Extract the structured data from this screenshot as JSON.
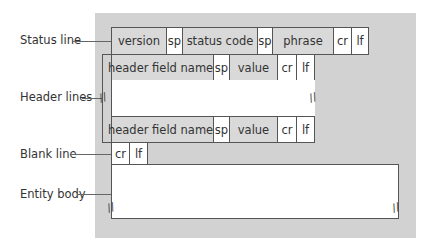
{
  "labels": {
    "status_line": "Status line",
    "header_lines": "Header lines",
    "blank_line": "Blank line",
    "entity_body": "Entity body"
  },
  "status_line": {
    "version": "version",
    "sp1": "sp",
    "status_code": "status code",
    "sp2": "sp",
    "phrase": "phrase",
    "cr": "cr",
    "lf": "lf"
  },
  "header_rows": [
    {
      "name": "header field name:",
      "sp": "sp",
      "value": "value",
      "cr": "cr",
      "lf": "lf"
    },
    {
      "name": "header field name:",
      "sp": "sp",
      "value": "value",
      "cr": "cr",
      "lf": "lf"
    }
  ],
  "blank_line": {
    "cr": "cr",
    "lf": "lf"
  },
  "break_mark": "//",
  "colors": {
    "panel": "#d2d2d2",
    "cell_gray": "#d9d9d9",
    "cell_white": "#ffffff",
    "border": "#555555"
  }
}
